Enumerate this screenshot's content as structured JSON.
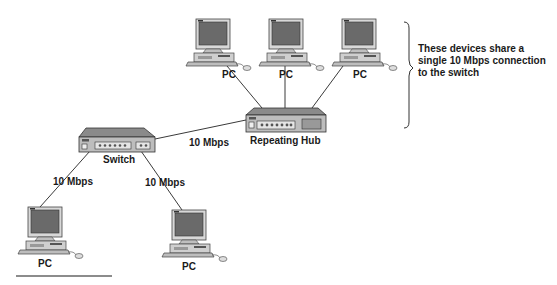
{
  "nodes": {
    "pc_top_left": {
      "label": "PC"
    },
    "pc_top_center": {
      "label": "PC"
    },
    "pc_top_right": {
      "label": "PC"
    },
    "repeating_hub": {
      "label": "Repeating Hub"
    },
    "switch": {
      "label": "Switch"
    },
    "pc_bottom_left": {
      "label": "PC"
    },
    "pc_bottom_right": {
      "label": "PC"
    }
  },
  "links": {
    "switch_to_hub": {
      "label": "10 Mbps"
    },
    "switch_to_pc_left": {
      "label": "10 Mbps"
    },
    "switch_to_pc_right": {
      "label": "10 Mbps"
    }
  },
  "annotation": {
    "lines": [
      "These devices share a",
      "single 10 Mbps connection",
      "to the switch"
    ]
  }
}
